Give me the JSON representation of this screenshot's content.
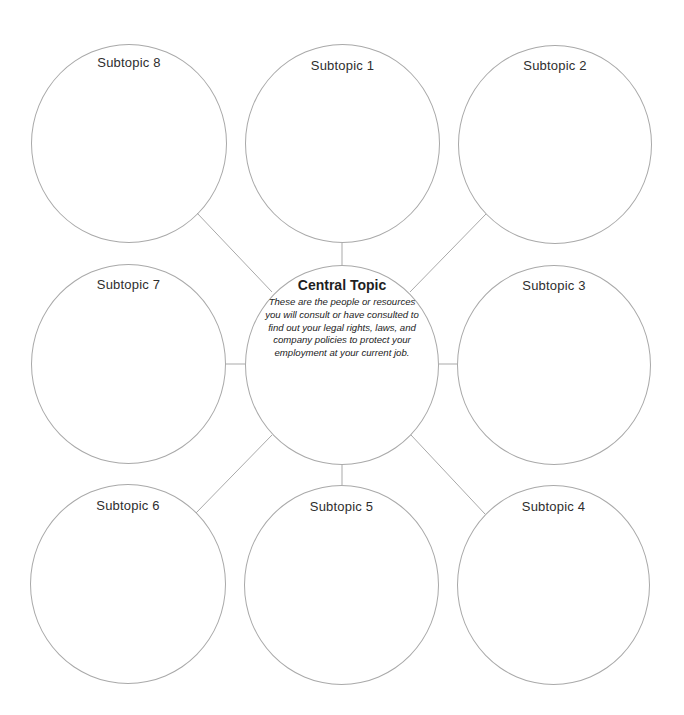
{
  "diagram": {
    "type": "bubble map",
    "central": {
      "title": "Central Topic",
      "description": "These are the people or resources you will consult or have consulted to find out your legal rights, laws, and company policies to protect your employment at your current job."
    },
    "subtopics": [
      {
        "label": "Subtopic 1"
      },
      {
        "label": "Subtopic 2"
      },
      {
        "label": "Subtopic 3"
      },
      {
        "label": "Subtopic 4"
      },
      {
        "label": "Subtopic 5"
      },
      {
        "label": "Subtopic 6"
      },
      {
        "label": "Subtopic 7"
      },
      {
        "label": "Subtopic 8"
      }
    ],
    "colors": {
      "line": "#a9a9a9",
      "text": "#2e2e2e",
      "background": "#ffffff"
    }
  }
}
